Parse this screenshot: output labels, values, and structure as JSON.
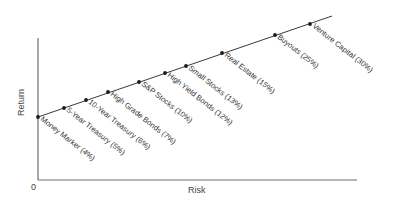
{
  "chart_data": {
    "type": "line",
    "title": "",
    "xlabel": "Risk",
    "ylabel": "Return",
    "origin_label": "0",
    "grid": false,
    "legend": null,
    "line_color": "#3a3a3a",
    "axis_color": "#6e6e6e",
    "points": [
      {
        "label": "Money Marker (4%)",
        "return_pct": 4,
        "px": 38,
        "py": 117
      },
      {
        "label": "5-Year Treasury (5%)",
        "return_pct": 5,
        "px": 64,
        "py": 108
      },
      {
        "label": "10-Year Treasury (6%)",
        "return_pct": 6,
        "px": 86,
        "py": 100
      },
      {
        "label": "High Grade Bonds (7%)",
        "return_pct": 7,
        "px": 108,
        "py": 92
      },
      {
        "label": "S&P Stocks (10%)",
        "return_pct": 10,
        "px": 139,
        "py": 82
      },
      {
        "label": "High Yield Bonds (12%)",
        "return_pct": 12,
        "px": 165,
        "py": 73
      },
      {
        "label": "Small Stocks (13%)",
        "return_pct": 13,
        "px": 186,
        "py": 66
      },
      {
        "label": "Real Estate (15%)",
        "return_pct": 15,
        "px": 222,
        "py": 53
      },
      {
        "label": "Buyouts (25%)",
        "return_pct": 25,
        "px": 275,
        "py": 35
      },
      {
        "label": "Venture Capital (30%)",
        "return_pct": 30,
        "px": 310,
        "py": 24
      }
    ],
    "categories": [
      "Money Marker",
      "5-Year Treasury",
      "10-Year Treasury",
      "High Grade Bonds",
      "S&P Stocks",
      "High Yield Bonds",
      "Small Stocks",
      "Real Estate",
      "Buyouts",
      "Venture Capital"
    ],
    "values": [
      4,
      5,
      6,
      7,
      10,
      12,
      13,
      15,
      25,
      30
    ],
    "note": "Points lie on a single straight upward-sloping risk/return line; labels rotated ~38° below each point"
  }
}
